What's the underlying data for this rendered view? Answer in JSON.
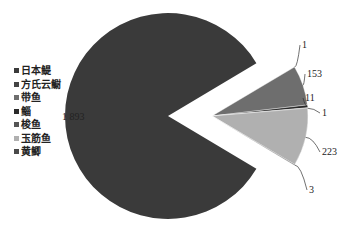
{
  "chart_data": {
    "type": "pie",
    "title": "",
    "categories": [
      "日本鳀",
      "方氏云鳚",
      "带鱼",
      "鲻",
      "梭鱼",
      "玉筋鱼",
      "黄鲫"
    ],
    "values": [
      1893,
      1,
      153,
      11,
      1,
      223,
      3
    ],
    "value_labels": [
      "1 893",
      "1",
      "153",
      "11",
      "1",
      "223",
      "3"
    ],
    "colors": [
      "#3a3a3a",
      "#d9d9d9",
      "#6e6e6e",
      "#2a2a2a",
      "#8a8a8a",
      "#b0b0b0",
      "#5a5a5a"
    ],
    "exploded": [
      false,
      true,
      true,
      true,
      true,
      true,
      true
    ],
    "legend_position": "left",
    "xlabel": "",
    "ylabel": ""
  },
  "legend": {
    "items": [
      {
        "label": "日本鳀",
        "color": "#3a3a3a"
      },
      {
        "label": "方氏云鳚",
        "color": "#444444"
      },
      {
        "label": "带鱼",
        "color": "#6e6e6e"
      },
      {
        "label": "鲻",
        "color": "#2a2a2a"
      },
      {
        "label": "梭鱼",
        "color": "#555555"
      },
      {
        "label": "玉筋鱼",
        "color": "#b0b0b0"
      },
      {
        "label": "黄鲫",
        "color": "#4a4a4a"
      }
    ]
  }
}
